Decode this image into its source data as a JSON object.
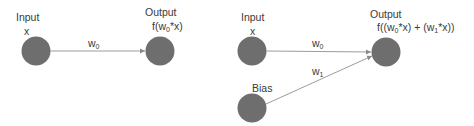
{
  "colors": {
    "node": "#6e6e6e",
    "edge": "#9c9c9c",
    "text": "#3a3a3a",
    "background": "#ffffff"
  },
  "diagram_left": {
    "input_label": "Input",
    "input_var": "x",
    "weight_label": "w",
    "weight_sub": "0",
    "output_label": "Output",
    "output_formula": {
      "prefix": "f(w",
      "sub0": "0",
      "suffix": "*x)"
    }
  },
  "diagram_right": {
    "input_label": "Input",
    "input_var": "x",
    "bias_label": "Bias",
    "weight0_label": "w",
    "weight0_sub": "0",
    "weight1_label": "w",
    "weight1_sub": "1",
    "output_label": "Output",
    "output_formula": {
      "p1": "f((w",
      "sub0": "0",
      "p2": "*x) + (w",
      "sub1": "1",
      "p3": "*x))"
    }
  }
}
